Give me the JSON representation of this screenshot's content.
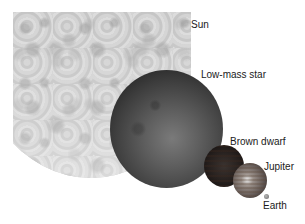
{
  "diagram": {
    "type": "size-comparison",
    "background_color": "#ffffff",
    "objects": [
      {
        "id": "sun",
        "label": "Sun",
        "color": "#d0d0d0"
      },
      {
        "id": "low_mass_star",
        "label": "Low-mass star",
        "color": "#4a4a4a"
      },
      {
        "id": "brown_dwarf",
        "label": "Brown dwarf",
        "color": "#1e1a1a"
      },
      {
        "id": "jupiter",
        "label": "Jupiter",
        "color": "#7a706a"
      },
      {
        "id": "earth",
        "label": "Earth",
        "color": "#8a8a8a"
      }
    ]
  }
}
